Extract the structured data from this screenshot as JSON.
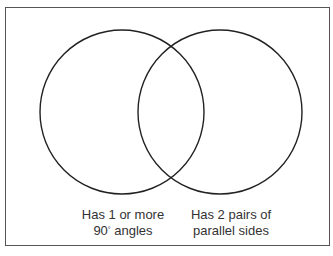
{
  "diagram": {
    "type": "venn",
    "sets": [
      {
        "id": "left",
        "label_line1": "Has 1 or more",
        "label_line2_number": "90",
        "label_line2_degree": "°",
        "label_line2_rest": " angles",
        "circle": {
          "cx": 122,
          "cy": 112,
          "r": 82
        }
      },
      {
        "id": "right",
        "label_line1": "Has 2 pairs of",
        "label_line2": "parallel sides",
        "circle": {
          "cx": 220,
          "cy": 112,
          "r": 82
        }
      }
    ],
    "stroke_color": "#222222"
  }
}
